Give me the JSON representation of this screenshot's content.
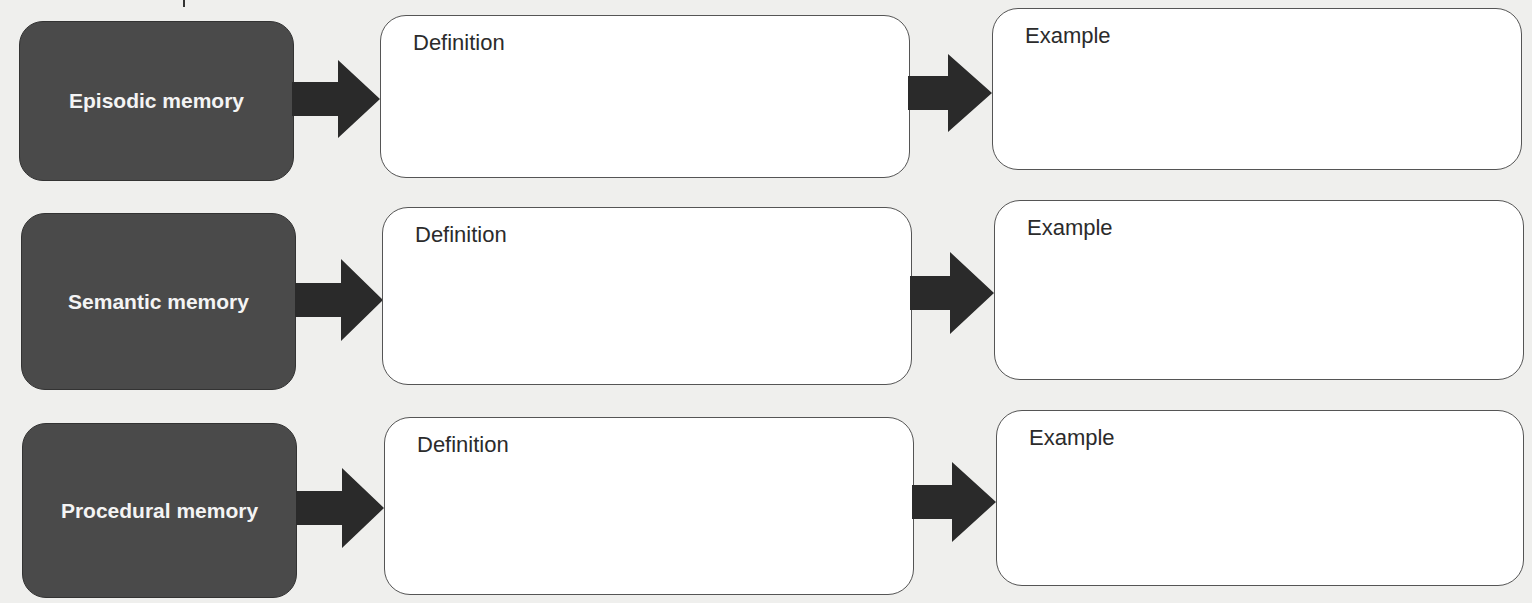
{
  "diagram": {
    "rows": [
      {
        "label": "Episodic memory",
        "definition_label": "Definition",
        "example_label": "Example"
      },
      {
        "label": "Semantic memory",
        "definition_label": "Definition",
        "example_label": "Example"
      },
      {
        "label": "Procedural memory",
        "definition_label": "Definition",
        "example_label": "Example"
      }
    ]
  },
  "colors": {
    "label_box": "#4a4a4a",
    "arrow": "#2a2a2a",
    "card_border": "#555555",
    "background": "#efefed"
  }
}
